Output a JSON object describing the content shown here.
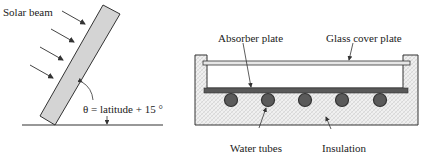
{
  "left_diagram": {
    "title_label": "Solar beam",
    "angle_label": "θ = latitude + 15 °",
    "elements": [
      "solar-beam-arrows",
      "tilted-collector",
      "ground-line",
      "tilt-angle-arc"
    ]
  },
  "right_diagram": {
    "labels": {
      "absorber_plate": "Absorber plate",
      "glass_cover_plate": "Glass cover plate",
      "water_tubes": "Water tubes",
      "insulation": "Insulation"
    },
    "tube_count": 5
  },
  "colors": {
    "panel_fill": "#d4d4d4",
    "absorber_fill": "#595959",
    "tube_fill": "#5a5a5a",
    "insulation_fill": "#efefef",
    "glass_fill": "#e6e6e6",
    "line": "#333333"
  }
}
